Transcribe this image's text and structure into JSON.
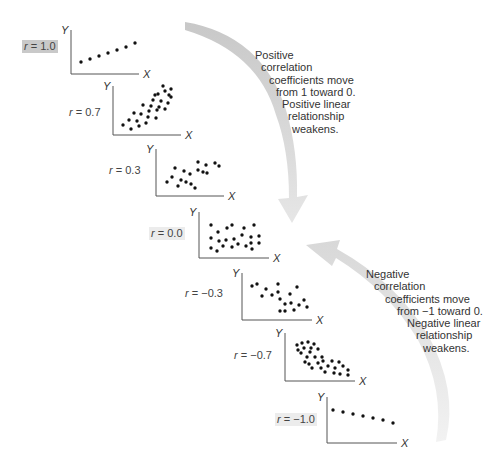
{
  "figure": {
    "positive_note": [
      "Positive",
      "correlation",
      "coefficients move",
      "from 1 toward 0.",
      "Positive linear",
      "relationship",
      "weakens."
    ],
    "negative_note": [
      "Negative",
      "correlation",
      "coefficients move",
      "from −1 toward 0.",
      "Negative linear",
      "relationship",
      "weakens."
    ],
    "arrow_color": "#d4d4d4",
    "highlight_color": "#c9c9c9"
  },
  "panels": [
    {
      "label": "r = 1.0",
      "r_symbol": "r",
      "r_value": "= 1.0",
      "highlight": "strong"
    },
    {
      "label": "r = 0.7",
      "r_symbol": "r",
      "r_value": "= 0.7",
      "highlight": "none"
    },
    {
      "label": "r = 0.3",
      "r_symbol": "r",
      "r_value": "= 0.3",
      "highlight": "none"
    },
    {
      "label": "r = 0.0",
      "r_symbol": "r",
      "r_value": "= 0.0",
      "highlight": "light"
    },
    {
      "label": "r = −0.3",
      "r_symbol": "r",
      "r_value": "= −0.3",
      "highlight": "none"
    },
    {
      "label": "r = −0.7",
      "r_symbol": "r",
      "r_value": "= −0.7",
      "highlight": "none"
    },
    {
      "label": "r = −1.0",
      "r_symbol": "r",
      "r_value": "= −1.0",
      "highlight": "light"
    }
  ],
  "axes": {
    "x_label": "X",
    "y_label": "Y"
  },
  "chart_data": {
    "type": "scatter",
    "title": "",
    "xlabel": "X",
    "ylabel": "Y",
    "grid": false,
    "series": [
      {
        "name": "r = 1.0",
        "r": 1.0,
        "points": [
          [
            10,
            12
          ],
          [
            19,
            15
          ],
          [
            28,
            18
          ],
          [
            37,
            21
          ],
          [
            46,
            24
          ],
          [
            55,
            27
          ],
          [
            64,
            31
          ]
        ]
      },
      {
        "name": "r = 0.7",
        "r": 0.7,
        "points": [
          [
            10,
            10
          ],
          [
            18,
            6
          ],
          [
            26,
            9
          ],
          [
            16,
            15
          ],
          [
            24,
            14
          ],
          [
            33,
            12
          ],
          [
            21,
            22
          ],
          [
            28,
            21
          ],
          [
            35,
            18
          ],
          [
            43,
            17
          ],
          [
            44,
            25
          ],
          [
            30,
            30
          ],
          [
            38,
            29
          ],
          [
            46,
            28
          ],
          [
            52,
            26
          ],
          [
            40,
            35
          ],
          [
            48,
            34
          ],
          [
            55,
            32
          ],
          [
            58,
            38
          ],
          [
            45,
            41
          ],
          [
            52,
            44
          ],
          [
            58,
            46
          ],
          [
            50,
            49
          ],
          [
            42,
            40
          ],
          [
            56,
            40
          ],
          [
            36,
            24
          ]
        ]
      },
      {
        "name": "r = 0.3",
        "r": 0.3,
        "points": [
          [
            11,
            14
          ],
          [
            16,
            19
          ],
          [
            22,
            10
          ],
          [
            25,
            16
          ],
          [
            30,
            14
          ],
          [
            35,
            12
          ],
          [
            39,
            8
          ],
          [
            19,
            28
          ],
          [
            28,
            25
          ],
          [
            34,
            22
          ],
          [
            42,
            26
          ],
          [
            47,
            24
          ],
          [
            51,
            23
          ],
          [
            42,
            34
          ],
          [
            50,
            31
          ],
          [
            59,
            33
          ],
          [
            63,
            30
          ]
        ]
      },
      {
        "name": "r = 0.0",
        "r": 0.0,
        "points": [
          [
            12,
            10
          ],
          [
            18,
            7
          ],
          [
            24,
            12
          ],
          [
            33,
            11
          ],
          [
            39,
            14
          ],
          [
            47,
            12
          ],
          [
            53,
            9
          ],
          [
            12,
            20
          ],
          [
            20,
            17
          ],
          [
            27,
            18
          ],
          [
            35,
            19
          ],
          [
            43,
            23
          ],
          [
            52,
            21
          ],
          [
            60,
            22
          ],
          [
            60,
            15
          ],
          [
            52,
            15
          ],
          [
            19,
            26
          ],
          [
            28,
            30
          ],
          [
            33,
            33
          ],
          [
            45,
            30
          ],
          [
            55,
            33
          ],
          [
            12,
            33
          ]
        ]
      },
      {
        "name": "r = −0.3",
        "r": -0.3,
        "points": [
          [
            10,
            34
          ],
          [
            15,
            36
          ],
          [
            24,
            31
          ],
          [
            36,
            36
          ],
          [
            20,
            24
          ],
          [
            30,
            25
          ],
          [
            36,
            28
          ],
          [
            38,
            21
          ],
          [
            48,
            26
          ],
          [
            55,
            33
          ],
          [
            43,
            16
          ],
          [
            49,
            17
          ],
          [
            57,
            15
          ],
          [
            62,
            20
          ],
          [
            65,
            13
          ],
          [
            52,
            10
          ],
          [
            38,
            9
          ],
          [
            43,
            9
          ]
        ]
      },
      {
        "name": "r = −0.7",
        "r": -0.7,
        "points": [
          [
            12,
            36
          ],
          [
            17,
            38
          ],
          [
            23,
            39
          ],
          [
            29,
            37
          ],
          [
            13,
            31
          ],
          [
            19,
            33
          ],
          [
            26,
            33
          ],
          [
            33,
            32
          ],
          [
            16,
            28
          ],
          [
            25,
            29
          ],
          [
            22,
            24
          ],
          [
            30,
            24
          ],
          [
            37,
            24
          ],
          [
            20,
            19
          ],
          [
            33,
            18
          ],
          [
            24,
            17
          ],
          [
            27,
            13
          ],
          [
            36,
            13
          ],
          [
            43,
            15
          ],
          [
            40,
            9
          ],
          [
            50,
            13
          ],
          [
            58,
            15
          ],
          [
            54,
            19
          ],
          [
            63,
            11
          ],
          [
            49,
            8
          ],
          [
            55,
            7
          ],
          [
            63,
            6
          ],
          [
            47,
            20
          ],
          [
            38,
            20
          ]
        ]
      },
      {
        "name": "r = −1.0",
        "r": -1.0,
        "points": [
          [
            6,
            33
          ],
          [
            16,
            31
          ],
          [
            26,
            29
          ],
          [
            36,
            27
          ],
          [
            46,
            25
          ],
          [
            56,
            23
          ],
          [
            66,
            20
          ]
        ]
      }
    ]
  }
}
